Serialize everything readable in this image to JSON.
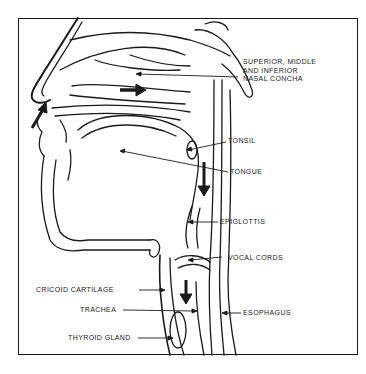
{
  "diagram": {
    "labels": {
      "concha": "SUPERIOR, MIDDLE\nAND INFERIOR\nNASAL CONCHA",
      "tonsil": "TONSIL",
      "tongue": "TONGUE",
      "epiglottis": "EPIGLOTTIS",
      "vocal_cords": "VOCAL CORDS",
      "cricoid": "CRICOID CARTILAGE",
      "trachea": "TRACHEA",
      "esophagus": "ESOPHAGUS",
      "thyroid": "THYROID GLAND"
    },
    "colors": {
      "ink": "#1a1a1a",
      "paper": "#ffffff"
    }
  }
}
